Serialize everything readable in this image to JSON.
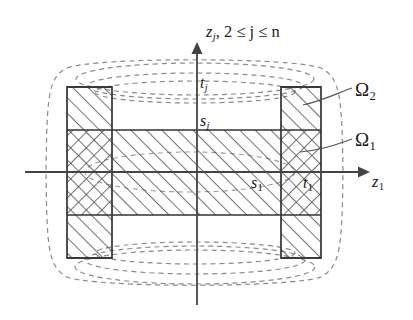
{
  "figure": {
    "background_color": "#ffffff",
    "line_color": "#333333",
    "dashed_color": "#8a8a8a",
    "hatch_color": "#4d4d4d"
  },
  "axes": {
    "vertical": {
      "name": "z_j axis",
      "label_main": "z",
      "label_sub": "j",
      "label_rest": ", 2 ≤ j ≤ n",
      "x": 197,
      "y_top": 42,
      "y_bottom": 305
    },
    "horizontal": {
      "name": "z_1 axis",
      "label_main": "z",
      "label_sub": "1",
      "y": 172,
      "x_left": 25,
      "x_right": 370
    }
  },
  "tick_labels": [
    {
      "name": "t-j",
      "main": "t",
      "sub": "j",
      "axis": "vertical",
      "value_y": 87
    },
    {
      "name": "s-j",
      "main": "s",
      "sub": "j",
      "axis": "vertical",
      "value_y": 130
    },
    {
      "name": "s-1",
      "main": "s",
      "sub": "1",
      "axis": "horizontal",
      "value_x": 281
    },
    {
      "name": "t-1",
      "main": "t",
      "sub": "1",
      "axis": "horizontal",
      "value_x": 321
    }
  ],
  "region_labels": [
    {
      "name": "omega-2",
      "main": "Ω",
      "sub": "2"
    },
    {
      "name": "omega-1",
      "main": "Ω",
      "sub": "1"
    }
  ],
  "geometry": {
    "outer_box": {
      "x1": 67,
      "y1": 87,
      "x2": 321,
      "y2": 258
    },
    "left_column": {
      "x1": 67,
      "x2": 112
    },
    "right_column": {
      "x1": 281,
      "x2": 321
    },
    "middle_band": {
      "y1": 130,
      "y2": 215
    },
    "hatch_legend": {
      "diagonal": "Ω₂ region single diagonal hatch",
      "crosshatch": "overlap of Ω₁ and Ω₂"
    }
  }
}
